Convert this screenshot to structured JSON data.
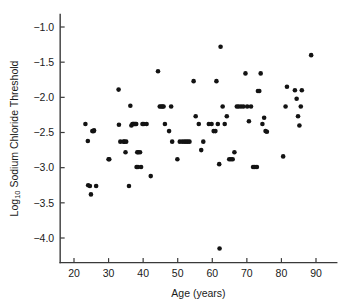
{
  "chart_data": {
    "type": "scatter",
    "title": "",
    "xlabel": "Age (years)",
    "ylabel": "Log10 Sodium Chloride Threshold",
    "ylabel_main": "Log",
    "ylabel_subscript": "10",
    "ylabel_rest": " Sodium Chloride Threshold",
    "xlim": [
      16,
      96
    ],
    "ylim": [
      -4.35,
      -0.82
    ],
    "grid": false,
    "legend": null,
    "marker": "filled-circle",
    "marker_color": "#131313",
    "xticks": [
      20,
      30,
      40,
      50,
      60,
      70,
      80,
      90
    ],
    "xtick_labels": [
      "20",
      "30",
      "40",
      "50",
      "60",
      "70",
      "80",
      "90"
    ],
    "yticks": [
      -1.0,
      -1.5,
      -2.0,
      -2.5,
      -3.0,
      -3.5,
      -4.0
    ],
    "ytick_labels": [
      "−1.0",
      "−1.5",
      "−2.0",
      "−2.5",
      "−3.0",
      "−3.5",
      "−4.0"
    ],
    "x": [
      23.3,
      24.1,
      24.6,
      25.3,
      25.7,
      24.0,
      24.9,
      25.8,
      26.4,
      30.0,
      30.2,
      32.9,
      33.0,
      33.4,
      34.3,
      34.6,
      34.9,
      35.1,
      35.9,
      36.3,
      36.6,
      36.9,
      37.1,
      37.3,
      37.5,
      37.8,
      38.0,
      38.3,
      38.6,
      38.1,
      38.5,
      39.1,
      39.4,
      39.8,
      40.2,
      41.0,
      42.2,
      44.3,
      44.8,
      45.2,
      45.6,
      45.9,
      46.3,
      47.5,
      48.1,
      48.4,
      49.9,
      50.6,
      51.3,
      51.9,
      52.4,
      52.9,
      53.4,
      54.6,
      55.2,
      56.1,
      56.8,
      57.4,
      59.0,
      59.8,
      60.4,
      60.9,
      61.2,
      61.6,
      62.0,
      62.4,
      63.0,
      63.6,
      64.2,
      64.9,
      65.4,
      65.9,
      66.4,
      67.1,
      67.6,
      68.3,
      69.0,
      69.6,
      70.1,
      70.6,
      71.2,
      71.8,
      72.3,
      72.9,
      73.2,
      73.6,
      74.0,
      74.5,
      75.0,
      75.4,
      75.8,
      80.5,
      81.2,
      81.6,
      83.9,
      84.4,
      84.8,
      85.2,
      85.6,
      85.9,
      88.6,
      62.1
    ],
    "y": [
      -2.38,
      -3.25,
      -3.26,
      -2.48,
      -2.48,
      -2.62,
      -3.38,
      -2.47,
      -3.26,
      -2.88,
      -2.88,
      -1.89,
      -2.39,
      -2.63,
      -2.63,
      -2.63,
      -2.78,
      -2.63,
      -3.26,
      -2.12,
      -2.4,
      -2.38,
      -2.38,
      -2.38,
      -2.38,
      -2.38,
      -2.38,
      -2.78,
      -2.78,
      -2.99,
      -2.99,
      -2.78,
      -2.99,
      -2.38,
      -2.38,
      -2.38,
      -3.12,
      -1.63,
      -2.13,
      -2.13,
      -2.13,
      -2.13,
      -2.38,
      -2.48,
      -2.13,
      -2.63,
      -2.88,
      -2.63,
      -2.63,
      -2.63,
      -2.63,
      -2.63,
      -2.63,
      -1.77,
      -2.27,
      -2.38,
      -2.75,
      -2.63,
      -2.38,
      -2.38,
      -2.48,
      -2.48,
      -1.77,
      -2.38,
      -2.95,
      -1.28,
      -2.13,
      -2.38,
      -2.27,
      -2.88,
      -2.88,
      -2.88,
      -2.78,
      -2.13,
      -2.13,
      -2.13,
      -2.13,
      -1.66,
      -2.13,
      -2.34,
      -2.13,
      -2.99,
      -2.99,
      -2.99,
      -1.91,
      -1.91,
      -1.66,
      -2.38,
      -2.29,
      -2.48,
      -2.49,
      -2.84,
      -2.13,
      -1.85,
      -1.9,
      -2.02,
      -2.27,
      -2.4,
      -2.13,
      -1.9,
      -1.4,
      -4.15
    ],
    "n_points": 102
  }
}
